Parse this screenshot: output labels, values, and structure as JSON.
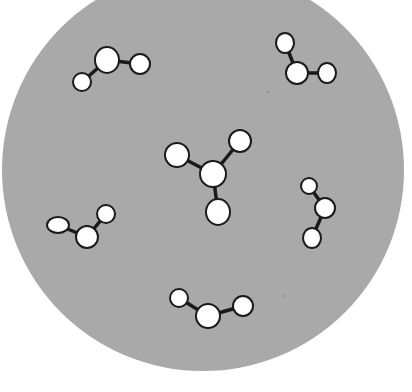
{
  "figure": {
    "background": "#ffffff",
    "container": {
      "cx": 203,
      "cy": 170,
      "r": 201,
      "fill": "#a9a9a9"
    },
    "atom_fill": "#ffffff",
    "atom_stroke": "#1a1a1a",
    "bond_color": "#1a1a1a",
    "molecules": [
      {
        "name": "molecule-top-left",
        "atoms": [
          {
            "x": 107,
            "y": 60,
            "rx": 12,
            "ry": 13
          },
          {
            "x": 140,
            "y": 64,
            "rx": 10,
            "ry": 10
          },
          {
            "x": 82,
            "y": 82,
            "rx": 9,
            "ry": 9
          }
        ],
        "bonds": [
          [
            0,
            1
          ],
          [
            0,
            2
          ]
        ]
      },
      {
        "name": "molecule-top-right",
        "atoms": [
          {
            "x": 285,
            "y": 43,
            "rx": 9,
            "ry": 10
          },
          {
            "x": 297,
            "y": 73,
            "rx": 11,
            "ry": 11
          },
          {
            "x": 327,
            "y": 73,
            "rx": 9,
            "ry": 10
          }
        ],
        "bonds": [
          [
            0,
            1
          ],
          [
            1,
            2
          ]
        ]
      },
      {
        "name": "molecule-center",
        "atoms": [
          {
            "x": 213,
            "y": 174,
            "rx": 13,
            "ry": 13
          },
          {
            "x": 177,
            "y": 155,
            "rx": 12,
            "ry": 12
          },
          {
            "x": 240,
            "y": 141,
            "rx": 11,
            "ry": 11
          },
          {
            "x": 218,
            "y": 212,
            "rx": 12,
            "ry": 13
          }
        ],
        "bonds": [
          [
            0,
            1
          ],
          [
            0,
            2
          ],
          [
            0,
            3
          ]
        ]
      },
      {
        "name": "molecule-left",
        "atoms": [
          {
            "x": 58,
            "y": 225,
            "rx": 11,
            "ry": 8
          },
          {
            "x": 87,
            "y": 237,
            "rx": 11,
            "ry": 11
          },
          {
            "x": 106,
            "y": 214,
            "rx": 9,
            "ry": 9
          }
        ],
        "bonds": [
          [
            0,
            1
          ],
          [
            1,
            2
          ]
        ]
      },
      {
        "name": "molecule-right",
        "atoms": [
          {
            "x": 309,
            "y": 186,
            "rx": 8,
            "ry": 8
          },
          {
            "x": 325,
            "y": 208,
            "rx": 10,
            "ry": 10
          },
          {
            "x": 312,
            "y": 238,
            "rx": 9,
            "ry": 10
          }
        ],
        "bonds": [
          [
            0,
            1
          ],
          [
            1,
            2
          ]
        ]
      },
      {
        "name": "molecule-bottom",
        "atoms": [
          {
            "x": 179,
            "y": 298,
            "rx": 9,
            "ry": 9
          },
          {
            "x": 208,
            "y": 316,
            "rx": 12,
            "ry": 12
          },
          {
            "x": 243,
            "y": 306,
            "rx": 10,
            "ry": 10
          }
        ],
        "bonds": [
          [
            0,
            1
          ],
          [
            1,
            2
          ]
        ]
      }
    ],
    "specks": [
      {
        "x": 268,
        "y": 92
      },
      {
        "x": 285,
        "y": 296
      }
    ]
  }
}
